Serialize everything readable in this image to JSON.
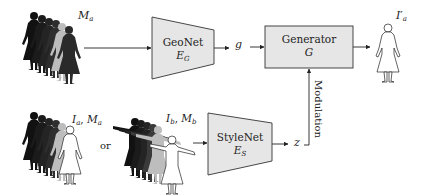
{
  "diagram": {
    "inputs": {
      "top_label_base": "M",
      "top_label_sub": "a",
      "bottom_left_label": "I",
      "bottom_left_label_sub": "a",
      "bottom_left_label2": "M",
      "bottom_left_label2_sub": "a",
      "or_text": "or",
      "bottom_right_label": "I",
      "bottom_right_label_sub": "b",
      "bottom_right_label2": "M",
      "bottom_right_label2_sub": "b"
    },
    "geonet": {
      "title": "GeoNet",
      "symbol": "E",
      "symbol_sub": "G"
    },
    "stylenet": {
      "title": "StyleNet",
      "symbol": "E",
      "symbol_sub": "S"
    },
    "generator": {
      "title": "Generator",
      "symbol": "G"
    },
    "signals": {
      "geometry_code": "g",
      "style_code": "z",
      "modulation": "Modulation"
    },
    "output": {
      "label": "I",
      "label_prime": "′",
      "label_sub": "a"
    },
    "colors": {
      "box_fill": "#e6e6e6",
      "stroke": "#333333",
      "silhouette": "#1a1a1a"
    }
  }
}
